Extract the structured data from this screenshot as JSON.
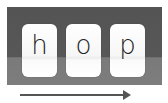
{
  "tiles": [
    {
      "letter": "h"
    },
    {
      "letter": "o"
    },
    {
      "letter": "p"
    }
  ],
  "arrow": {
    "direction": "right"
  },
  "colors": {
    "panel_top": "#555555",
    "panel_bottom": "#7a7a7a",
    "tile": "#ffffff",
    "text": "#222222",
    "arrow": "#555555"
  }
}
